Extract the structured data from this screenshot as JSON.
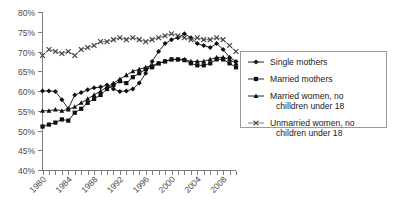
{
  "chart_data": {
    "type": "line",
    "title": "",
    "xlabel": "",
    "ylabel": "",
    "xlim": [
      1980,
      2010
    ],
    "ylim": [
      40,
      80
    ],
    "ytick_labels": [
      "80%",
      "75%",
      "70%",
      "65%",
      "60%",
      "55%",
      "50%",
      "45%",
      "40%"
    ],
    "ytick_values": [
      80,
      75,
      70,
      65,
      60,
      55,
      50,
      45,
      40
    ],
    "xtick_labels": [
      "1980",
      "1984",
      "1988",
      "1992",
      "1996",
      "2000",
      "2004",
      "2008"
    ],
    "xtick_values": [
      1980,
      1984,
      1988,
      1992,
      1996,
      2000,
      2004,
      2008
    ],
    "x": [
      1980,
      1981,
      1982,
      1983,
      1984,
      1985,
      1986,
      1987,
      1988,
      1989,
      1990,
      1991,
      1992,
      1993,
      1994,
      1995,
      1996,
      1997,
      1998,
      1999,
      2000,
      2001,
      2002,
      2003,
      2004,
      2005,
      2006,
      2007,
      2008,
      2009,
      2010
    ],
    "grid": false,
    "legend_position": "right",
    "series": [
      {
        "name": "Single mothers",
        "marker": "diamond",
        "values": [
          60.0,
          60.0,
          59.9,
          57.8,
          55.5,
          59.0,
          59.6,
          60.3,
          60.8,
          61.0,
          61.5,
          60.5,
          59.9,
          60.0,
          60.5,
          62.0,
          64.5,
          67.5,
          70.0,
          72.0,
          73.0,
          73.5,
          74.5,
          73.5,
          72.0,
          71.5,
          71.0,
          72.0,
          70.5,
          68.5,
          67.5
        ]
      },
      {
        "name": "Married mothers",
        "marker": "square",
        "values": [
          51.0,
          51.5,
          52.0,
          52.8,
          52.5,
          54.5,
          55.5,
          57.0,
          58.0,
          59.0,
          60.5,
          61.5,
          62.5,
          62.0,
          63.5,
          64.5,
          65.5,
          66.0,
          67.0,
          67.5,
          68.0,
          68.0,
          67.8,
          67.0,
          66.5,
          66.5,
          67.0,
          68.0,
          68.0,
          67.0,
          66.0
        ]
      },
      {
        "name": "Married women, no chilldren under 18",
        "marker": "triangle",
        "values": [
          55.0,
          55.0,
          55.3,
          55.0,
          55.3,
          56.0,
          57.0,
          58.0,
          59.0,
          60.0,
          61.0,
          62.0,
          63.0,
          64.0,
          65.0,
          65.5,
          66.0,
          66.5,
          67.0,
          67.5,
          68.0,
          68.0,
          68.0,
          67.5,
          67.5,
          67.5,
          68.0,
          68.5,
          68.5,
          68.0,
          67.0
        ]
      },
      {
        "name": "Unmarried women, no children under 18",
        "marker": "cross",
        "values": [
          69.0,
          70.5,
          70.0,
          69.5,
          70.0,
          69.0,
          70.5,
          71.0,
          71.5,
          72.5,
          72.5,
          73.0,
          73.5,
          73.0,
          73.5,
          73.0,
          72.5,
          73.0,
          73.5,
          74.0,
          74.5,
          74.0,
          73.5,
          73.0,
          73.5,
          73.0,
          73.0,
          73.5,
          73.0,
          71.5,
          70.0
        ]
      }
    ],
    "legend": [
      {
        "label": "Single mothers",
        "marker": "diamond"
      },
      {
        "label": "Married mothers",
        "marker": "square"
      },
      {
        "label_line1": "Married women, no",
        "label_line2": "chilldren under 18",
        "marker": "triangle"
      },
      {
        "label_line1": "Unmarried women, no",
        "label_line2": "children under 18",
        "marker": "cross"
      }
    ],
    "colors": {
      "series_line": "#0f0f0f",
      "cross_line": "#5c5c5c",
      "axis": "#7d7d7d",
      "tick_text": "#4a4a4a",
      "legend_text": "#1a1a1a",
      "legend_border": "#9a9a9a",
      "background": "#ffffff"
    }
  }
}
